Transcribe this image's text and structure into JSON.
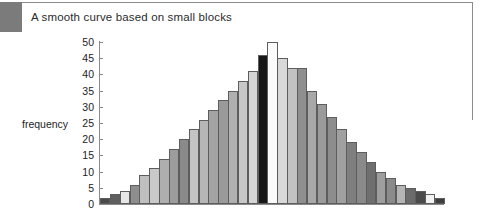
{
  "caption": "A smooth curve based on small blocks",
  "chart_data": {
    "type": "bar",
    "title": "A smooth curve based on small blocks",
    "xlabel": "",
    "ylabel": "frequency",
    "ylim": [
      0,
      50
    ],
    "yticks": [
      0,
      5,
      10,
      15,
      20,
      25,
      30,
      35,
      40,
      45,
      50
    ],
    "ytick_labels": [
      "0",
      "5",
      "10",
      "15",
      "20",
      "25",
      "30",
      "35",
      "40",
      "45",
      "50"
    ],
    "grid": false,
    "legend": null,
    "categories": [
      "1",
      "2",
      "3",
      "4",
      "5",
      "6",
      "7",
      "8",
      "9",
      "10",
      "11",
      "12",
      "13",
      "14",
      "15",
      "16",
      "17",
      "18",
      "19",
      "20",
      "21",
      "22",
      "23",
      "24",
      "25",
      "26",
      "27",
      "28",
      "29",
      "30",
      "31",
      "32",
      "33",
      "34",
      "35"
    ],
    "values": [
      2,
      3,
      4,
      6,
      9,
      11,
      14,
      17,
      20,
      23,
      26,
      29,
      32,
      35,
      38,
      41,
      46,
      50,
      45,
      42,
      42,
      35,
      31,
      27,
      23,
      19,
      16,
      13,
      10,
      8,
      6,
      5,
      4,
      3,
      2
    ],
    "bar_colors": [
      "#4a4a4a",
      "#5f5f5f",
      "#e6e6e6",
      "#8e8e8e",
      "#bfbfbf",
      "#c9c9c9",
      "#aeaeae",
      "#9c9c9c",
      "#8a8a8a",
      "#c4c4c4",
      "#b6b6b6",
      "#a3a3a3",
      "#9a9a9a",
      "#b0b0b0",
      "#c7c7c7",
      "#d5d5d5",
      "#171717",
      "#fbfbfb",
      "#d8d8d8",
      "#c2c2c2",
      "#8f8f8f",
      "#a8a8a8",
      "#9b9b9b",
      "#8d8d8d",
      "#a0a0a0",
      "#7f7f7f",
      "#8a8a8a",
      "#6f6f6f",
      "#9e9e9e",
      "#8b8b8b",
      "#b5b5b5",
      "#6b6b6b",
      "#4b4b4b",
      "#f2f2f2",
      "#3d3d3d"
    ]
  }
}
